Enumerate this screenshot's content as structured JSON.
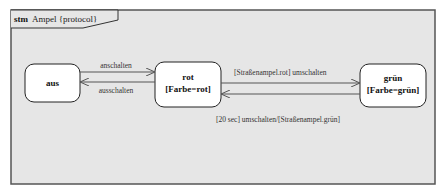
{
  "frame": {
    "kind": "stm",
    "name": "Ampel {protocol}"
  },
  "states": [
    {
      "id": "aus",
      "name": "aus",
      "invariant": ""
    },
    {
      "id": "rot",
      "name": "rot",
      "invariant": "[Farbe=rot]"
    },
    {
      "id": "gruen",
      "name": "grün",
      "invariant": "[Farbe=grün]"
    }
  ],
  "transitions": [
    {
      "from": "aus",
      "to": "rot",
      "label": "anschalten"
    },
    {
      "from": "rot",
      "to": "aus",
      "label": "ausschalten"
    },
    {
      "from": "rot",
      "to": "gruen",
      "label": "[Straßenampel.rot] umschalten"
    },
    {
      "from": "gruen",
      "to": "rot",
      "label": "[20 sec] umschalten/[Straßenampel.grün]"
    }
  ],
  "colors": {
    "background": "#e6e6e6",
    "frame_border": "#555555",
    "state_fill": "#ffffff",
    "state_border": "#222222",
    "line": "#555555"
  }
}
